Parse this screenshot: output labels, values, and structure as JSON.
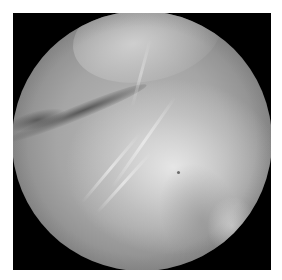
{
  "image": {
    "type": "arthroscopic-view",
    "description": "Grayscale circular endoscopic/arthroscopic view of fibrous tissue on black background",
    "colors": {
      "page_background": "#ffffff",
      "frame_background": "#000000",
      "tissue_mid": "#a5a5a5",
      "tissue_highlight": "#e6e6e6",
      "fold_shadow": "#404040"
    }
  }
}
